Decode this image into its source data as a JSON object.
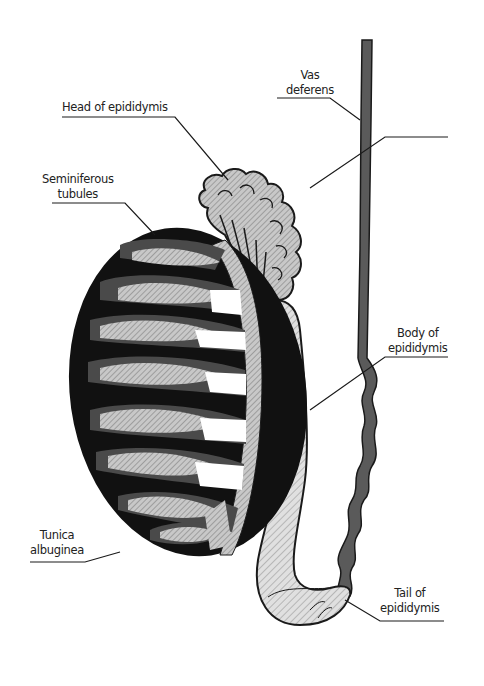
{
  "diagram": {
    "colors": {
      "background": "#ffffff",
      "outline": "#1a1a1a",
      "tunica": "#111111",
      "lobule_dark": "#4a4a4a",
      "hatch_fill": "#bdbdbd",
      "vas": "#555555"
    },
    "labels": [
      {
        "id": "vas-deferens",
        "lines": [
          "Vas",
          "deferens"
        ]
      },
      {
        "id": "head-of-epididymis",
        "lines": [
          "Head of epididymis"
        ]
      },
      {
        "id": "seminiferous-tubules",
        "lines": [
          "Seminiferous",
          "tubules"
        ]
      },
      {
        "id": "body-of-epididymis",
        "lines": [
          "Body of",
          "epididymis"
        ]
      },
      {
        "id": "tunica-albuginea",
        "lines": [
          "Tunica",
          "albuginea"
        ]
      },
      {
        "id": "tail-of-epididymis",
        "lines": [
          "Tail of",
          "epididymis"
        ]
      }
    ]
  }
}
